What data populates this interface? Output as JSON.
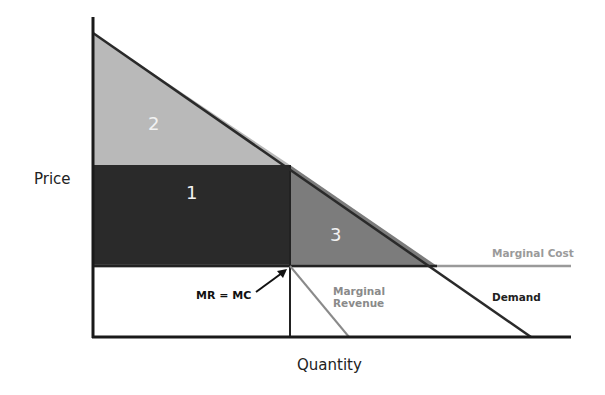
{
  "diagram": {
    "title": "",
    "axes": {
      "x_label": "Quantity",
      "y_label": "Price"
    },
    "regions": [
      {
        "id": "1",
        "label": "1",
        "fill": "#2a2a2a",
        "description": "rectangle between price and MC level, left of Q*"
      },
      {
        "id": "2",
        "label": "2",
        "fill": "#b9b9b9",
        "description": "triangle above price under demand"
      },
      {
        "id": "3",
        "label": "3",
        "fill": "#7c7c7c",
        "description": "triangle between demand and MC right of Q*"
      }
    ],
    "curves": {
      "demand": {
        "label": "Demand",
        "color": "#2a2a2a"
      },
      "marginal_cost": {
        "label": "Marginal Cost",
        "color": "#9a9a9a"
      },
      "marginal_revenue": {
        "label_line1": "Marginal",
        "label_line2": "Revenue",
        "color": "#8a8a8a"
      }
    },
    "annotation": {
      "label": "MR = MC"
    }
  },
  "colors": {
    "axis": "#1a1a1a",
    "background": "#ffffff"
  }
}
